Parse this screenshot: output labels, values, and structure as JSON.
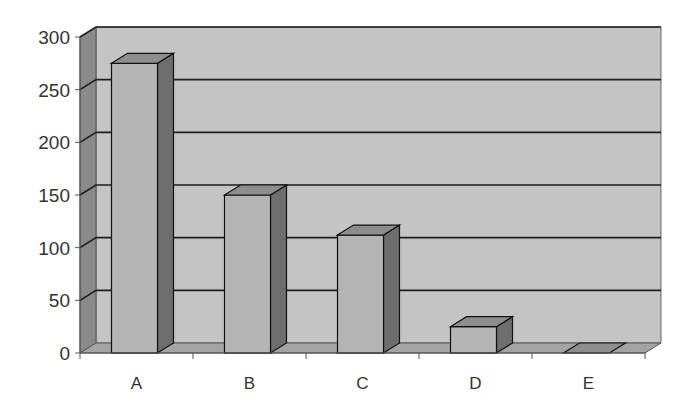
{
  "chart_data": {
    "type": "bar",
    "style": "3d-column",
    "title": "",
    "xlabel": "",
    "ylabel": "",
    "categories": [
      "A",
      "B",
      "C",
      "D",
      "E"
    ],
    "values": [
      275,
      150,
      112,
      25,
      0
    ],
    "ylim": [
      0,
      300
    ],
    "yticks": [
      0,
      50,
      100,
      150,
      200,
      250,
      300
    ],
    "grid": true,
    "legend": null
  },
  "colors": {
    "back_wall": "#c4c4c4",
    "side_wall": "#8a8a8a",
    "floor": "#a4a4a4",
    "bar_front": "#b4b4b4",
    "bar_top": "#8e8e8e",
    "bar_side": "#6e6e6e",
    "gridline": "#1e1e1e",
    "axis": "#555555"
  }
}
